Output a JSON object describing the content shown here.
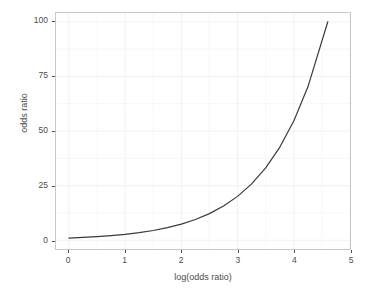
{
  "chart_data": {
    "type": "line",
    "title": "",
    "subtitle": "",
    "xlabel": "log(odds ratio)",
    "ylabel": "odds ratio",
    "xlim": [
      -0.23,
      5.0
    ],
    "ylim": [
      -4.0,
      104.0
    ],
    "xticks": [
      0,
      1,
      2,
      3,
      4,
      5
    ],
    "yticks": [
      0,
      25,
      50,
      75,
      100
    ],
    "xtick_labels": [
      "0",
      "1",
      "2",
      "3",
      "4",
      "5"
    ],
    "ytick_labels": [
      "0",
      "25",
      "50",
      "75",
      "100"
    ],
    "grid": true,
    "grid_color": "#f2f2f2",
    "legend": "none",
    "series": [
      {
        "name": "exp(x)",
        "color": "#3a3a3a",
        "width": 1.2,
        "x": [
          0.0,
          0.25,
          0.5,
          0.75,
          1.0,
          1.25,
          1.5,
          1.75,
          2.0,
          2.25,
          2.5,
          2.75,
          3.0,
          3.25,
          3.5,
          3.75,
          4.0,
          4.25,
          4.6052
        ],
        "y": [
          1.0,
          1.284,
          1.649,
          2.117,
          2.718,
          3.49,
          4.482,
          5.755,
          7.389,
          9.488,
          12.182,
          15.643,
          20.086,
          25.79,
          33.115,
          42.521,
          54.598,
          70.105,
          100.0
        ]
      }
    ]
  },
  "axes": {
    "panel_bg": "#ffffff",
    "panel_border": "#c8c8c8",
    "tick_text_color": "#4d4d4d"
  }
}
